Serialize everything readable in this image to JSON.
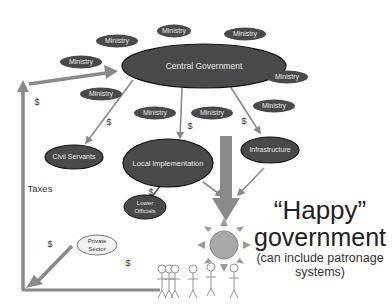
{
  "diagram": {
    "central": {
      "label": "Central Government"
    },
    "ministries": [
      {
        "label": "Ministry",
        "cx": 117,
        "cy": 41
      },
      {
        "label": "Ministry",
        "cx": 174,
        "cy": 31
      },
      {
        "label": "Ministry",
        "cx": 245,
        "cy": 34
      },
      {
        "label": "Ministry",
        "cx": 81,
        "cy": 62
      },
      {
        "label": "Ministry",
        "cx": 287,
        "cy": 77
      },
      {
        "label": "Ministry",
        "cx": 101,
        "cy": 94
      },
      {
        "label": "Ministry",
        "cx": 155,
        "cy": 113
      },
      {
        "label": "Ministry",
        "cx": 212,
        "cy": 113
      },
      {
        "label": "Ministry",
        "cx": 274,
        "cy": 106
      }
    ],
    "nodes": {
      "civil_servants": "Civil Servants",
      "local_implementation": "Local implementation",
      "infrastructure": "Infrastructure",
      "lower_officials_line1": "Lower",
      "lower_officials_line2": "Officials",
      "private_sector_line1": "Private",
      "private_sector_line2": "Sector"
    },
    "labels": {
      "taxes": "Taxes",
      "dollar": "$"
    },
    "happy": {
      "line1": "“Happy”",
      "line2": "government",
      "line3": "(can include patronage",
      "line4": "systems)"
    },
    "colors": {
      "ellipse_fill": "#4a4a4a",
      "ellipse_stroke": "#111111",
      "arrow": "#8a8a8a",
      "sun": "#a8a8a8",
      "private_fill": "#f2f2f2"
    }
  }
}
